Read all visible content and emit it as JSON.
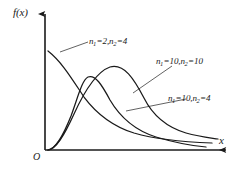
{
  "figure": {
    "background_color": "#ffffff",
    "line_color": "#1a1a1a"
  },
  "axes": {
    "y_label": "f(x)",
    "x_label": "x",
    "origin_label": "O",
    "x_axis_y": 150,
    "y_axis_x": 45,
    "x_axis_end": 228,
    "y_axis_top": 12,
    "arrowheads": true,
    "ticks": false,
    "tick_labels": [],
    "grid": false
  },
  "chart_data": {
    "type": "line",
    "xlabel": "x",
    "ylabel": "f(x)",
    "grid": false,
    "legend_position": "inline-annotations",
    "xlim": [
      0,
      1
    ],
    "ylim": [
      0,
      1
    ],
    "series": [
      {
        "name": "n₁=2,n₂=4",
        "label_text": "n1=2,n2=4",
        "n1": 2,
        "n2": 4,
        "shape": "monotone-decreasing",
        "path": "M 48,51 C 62,62 72,79 84,97 C 96,113 112,126 134,133 C 158,140 186,142 212,143",
        "leader": "M 60,52 L 88,42"
      },
      {
        "name": "n₁=10,n₂=10",
        "label_text": "n1=10,n2=10",
        "n1": 10,
        "n2": 10,
        "shape": "unimodal",
        "peak_x": 110,
        "peak_y": 67,
        "path": "M 48,150 C 56,149 64,136 74,114 C 84,92 96,72 110,67 C 124,63 134,79 144,98 C 152,114 166,127 186,133 C 200,137 212,138 218,139",
        "leader": "M 133,93 L 172,66"
      },
      {
        "name": "n₁=10,n₂=4",
        "label_text": "n1=10,n2=4",
        "n1": 10,
        "n2": 4,
        "shape": "unimodal",
        "peak_x": 88,
        "peak_y": 77,
        "path": "M 48,150 C 56,149 63,136 71,116 C 78,97 82,80 88,77 C 95,74 102,85 110,100 C 120,117 134,130 156,137 C 176,143 194,146 206,147",
        "leader": "M 126,111 L 186,99"
      }
    ]
  },
  "annotations": {
    "curve_1": {
      "n1": "1",
      "n2": "2",
      "eq1": "=2,",
      "eq2": "=4",
      "base": "n"
    },
    "curve_2": {
      "n1": "1",
      "n2": "2",
      "eq1": "=10,",
      "eq2": "=10",
      "base": "n"
    },
    "curve_3": {
      "n1": "1",
      "n2": "2",
      "eq1": "=10,",
      "eq2": "=4",
      "base": "n"
    }
  }
}
